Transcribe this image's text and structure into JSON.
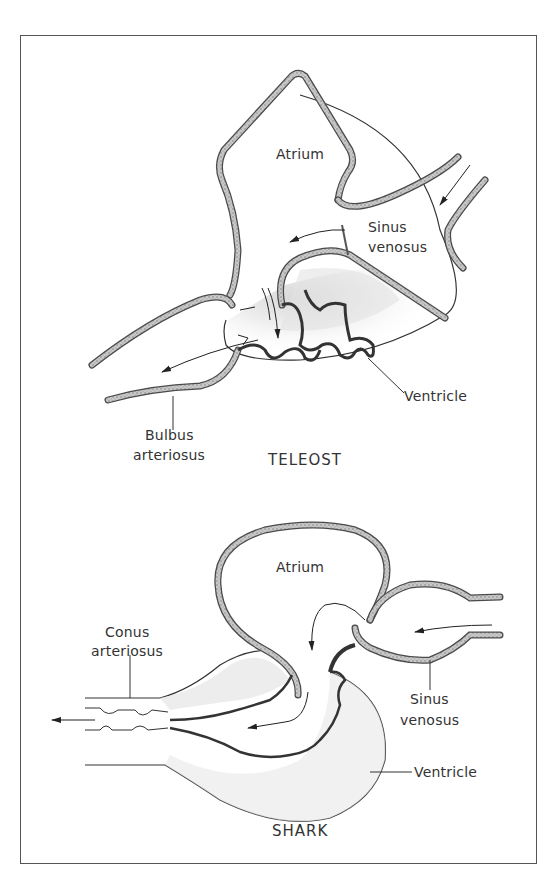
{
  "teleost": {
    "title": "TELEOST",
    "labels": {
      "atrium": "Atrium",
      "sinus_line1": "Sinus",
      "sinus_line2": "venosus",
      "ventricle": "Ventricle",
      "bulbus_line1": "Bulbus",
      "bulbus_line2": "arteriosus"
    }
  },
  "shark": {
    "title": "SHARK",
    "labels": {
      "atrium": "Atrium",
      "sinus_line1": "Sinus",
      "sinus_line2": "venosus",
      "ventricle": "Ventricle",
      "conus_line1": "Conus",
      "conus_line2": "arteriosus"
    }
  },
  "colors": {
    "vessel_fill": "#b8b8b8",
    "vessel_stroke": "#4a4a4a",
    "ink": "#333333",
    "frame": "#555555"
  }
}
